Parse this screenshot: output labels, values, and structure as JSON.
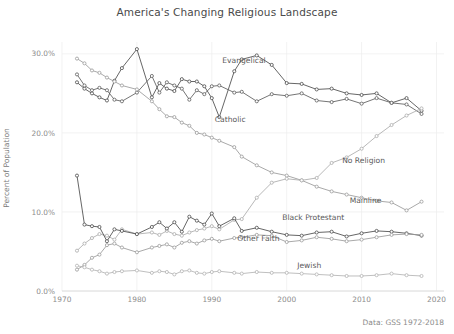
{
  "chart_data": {
    "type": "line",
    "title": "America's Changing Religious Landscape",
    "xlabel": "",
    "ylabel": "Percent of Population",
    "caption": "Data: GSS 1972-2018",
    "xlim": [
      1970,
      2021
    ],
    "ylim": [
      0.0,
      31.5
    ],
    "xticks": [
      1970,
      1980,
      1990,
      2000,
      2010,
      2020
    ],
    "xticklabels": [
      "1970",
      "1980",
      "1990",
      "2000",
      "2010",
      "2020"
    ],
    "yticks": [
      0.0,
      10.0,
      20.0,
      30.0
    ],
    "yticklabels": [
      "0.0%",
      "10.0%",
      "20.0%",
      "30.0%"
    ],
    "grid": true,
    "legend": "inline-annotations",
    "marker": "open-circle",
    "x": [
      1972,
      1973,
      1974,
      1975,
      1976,
      1977,
      1978,
      1980,
      1982,
      1983,
      1984,
      1985,
      1986,
      1987,
      1988,
      1989,
      1990,
      1991,
      1993,
      1994,
      1996,
      1998,
      2000,
      2002,
      2004,
      2006,
      2008,
      2010,
      2012,
      2014,
      2016,
      2018
    ],
    "series": [
      {
        "name": "Evangelical",
        "label": "Evangelical",
        "color": "#4a4a4a",
        "values": [
          26.4,
          25.6,
          25.0,
          24.5,
          24.1,
          26.6,
          28.2,
          30.6,
          24.5,
          26.3,
          25.6,
          25.3,
          26.8,
          26.5,
          26.5,
          25.9,
          24.4,
          22.0,
          27.8,
          29.3,
          29.8,
          28.6,
          26.3,
          26.2,
          25.5,
          25.6,
          25.0,
          24.8,
          25.0,
          23.8,
          24.4,
          22.8
        ]
      },
      {
        "name": "Catholic",
        "label": "Catholic",
        "color": "#5c5c5c",
        "values": [
          27.4,
          26.0,
          25.4,
          25.7,
          25.4,
          24.2,
          24.0,
          25.1,
          27.2,
          25.1,
          26.4,
          26.0,
          25.6,
          24.2,
          25.4,
          24.9,
          25.9,
          26.0,
          25.1,
          25.2,
          24.0,
          24.9,
          24.7,
          25.0,
          24.1,
          23.9,
          24.3,
          23.7,
          24.4,
          23.8,
          23.6,
          22.4
        ]
      },
      {
        "name": "Mainline",
        "label": "Mainline",
        "color": "#9a9a9a",
        "values": [
          29.4,
          28.8,
          27.9,
          27.6,
          27.0,
          26.5,
          26.0,
          25.5,
          24.0,
          23.0,
          22.1,
          22.0,
          21.3,
          20.9,
          20.0,
          19.8,
          19.4,
          19.0,
          18.2,
          17.0,
          15.9,
          15.0,
          14.6,
          14.0,
          13.2,
          12.6,
          12.2,
          11.8,
          11.4,
          11.2,
          10.2,
          11.3
        ]
      },
      {
        "name": "No Religion",
        "label": "No Religion",
        "color": "#ababab",
        "values": [
          5.1,
          6.0,
          6.7,
          7.2,
          7.0,
          6.5,
          7.8,
          7.2,
          7.4,
          7.1,
          7.6,
          7.2,
          7.0,
          7.4,
          7.7,
          7.9,
          8.2,
          7.8,
          9.0,
          9.1,
          11.8,
          13.7,
          14.2,
          14.0,
          14.3,
          16.2,
          16.9,
          18.0,
          19.6,
          21.0,
          22.2,
          23.1
        ]
      },
      {
        "name": "Black Protestant",
        "label": "Black Protestant",
        "color": "#4a4a4a",
        "values": [
          14.6,
          8.4,
          8.2,
          8.1,
          6.3,
          7.8,
          7.6,
          7.2,
          8.1,
          8.7,
          7.9,
          8.7,
          7.5,
          9.4,
          8.9,
          8.4,
          9.8,
          8.2,
          9.2,
          7.6,
          8.0,
          7.5,
          7.1,
          7.0,
          7.4,
          7.5,
          6.9,
          7.3,
          7.6,
          7.5,
          7.3,
          7.0
        ]
      },
      {
        "name": "Other Faith",
        "label": "Other Faith",
        "color": "#9a9a9a",
        "values": [
          2.7,
          3.3,
          4.2,
          4.6,
          5.8,
          6.0,
          5.5,
          4.9,
          5.5,
          5.7,
          5.9,
          5.5,
          6.1,
          6.3,
          6.0,
          6.4,
          6.6,
          6.3,
          6.7,
          6.8,
          7.1,
          7.0,
          6.2,
          6.4,
          6.8,
          6.6,
          6.3,
          6.5,
          6.8,
          7.1,
          7.2,
          7.1
        ]
      },
      {
        "name": "Jewish",
        "label": "Jewish",
        "color": "#b3b3b3",
        "values": [
          3.2,
          3.0,
          2.7,
          2.5,
          2.2,
          2.4,
          2.5,
          2.6,
          2.3,
          2.5,
          2.4,
          2.1,
          2.5,
          2.6,
          2.3,
          2.2,
          2.4,
          2.5,
          2.3,
          2.2,
          2.4,
          2.3,
          2.3,
          2.2,
          2.1,
          2.0,
          1.9,
          1.9,
          2.0,
          2.2,
          2.0,
          1.9
        ]
      }
    ],
    "annotations": [
      {
        "text": "Evangelical",
        "x": 1991,
        "y": 29.2
      },
      {
        "text": "Catholic",
        "x": 1990,
        "y": 21.7
      },
      {
        "text": "No Religion",
        "x": 2007,
        "y": 16.5
      },
      {
        "text": "Mainline",
        "x": 2008,
        "y": 11.5
      },
      {
        "text": "Black Protestant",
        "x": 1999,
        "y": 9.3
      },
      {
        "text": "Other Faith",
        "x": 1993,
        "y": 6.7
      },
      {
        "text": "Jewish",
        "x": 2001,
        "y": 3.3
      }
    ]
  }
}
